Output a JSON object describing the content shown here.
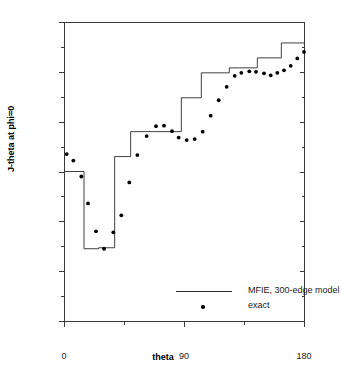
{
  "chart_data": {
    "type": "scatter",
    "title": "",
    "xlabel": "theta",
    "ylabel": "J-theta at phi=0",
    "xlim": [
      0,
      180
    ],
    "ylim": [
      0.0,
      0.006
    ],
    "grid": false,
    "x_ticks": [
      0,
      90,
      180
    ],
    "x_tick_labels": [
      "0",
      "90",
      "180"
    ],
    "x_minor_ticks": [
      45,
      135
    ],
    "y_ticks": [
      0.0,
      0.001,
      0.002,
      0.003,
      0.004,
      0.005,
      0.006
    ],
    "y_tick_labels": [
      "0.000",
      "0.001",
      "0.002",
      "0.003",
      "0.004",
      "0.005",
      "0.006"
    ],
    "y_minor_ticks": [
      0.0005,
      0.0015,
      0.0025,
      0.0035,
      0.0045,
      0.0055
    ],
    "legend_position": "center-bottom-inside",
    "series": [
      {
        "name": "MFIE, 300-edge model",
        "type": "step",
        "style": "line",
        "color": "#2b2b2b",
        "x": [
          0,
          15,
          15,
          26,
          26,
          38,
          38,
          50,
          50,
          68,
          68,
          88,
          88,
          103,
          103,
          124,
          124,
          145,
          145,
          163,
          163,
          180
        ],
        "y": [
          0.003,
          0.003,
          0.00145,
          0.00145,
          0.00147,
          0.00147,
          0.0033,
          0.0033,
          0.0038,
          0.0038,
          0.0038,
          0.0038,
          0.00448,
          0.00448,
          0.00498,
          0.00498,
          0.00508,
          0.00508,
          0.00528,
          0.00528,
          0.00558,
          0.00558
        ]
      },
      {
        "name": "exact",
        "type": "scatter",
        "style": "points",
        "color": "#000000",
        "points": [
          [
            2,
            0.00335
          ],
          [
            7,
            0.00322
          ],
          [
            13,
            0.0029
          ],
          [
            18,
            0.00236
          ],
          [
            24,
            0.0018
          ],
          [
            30,
            0.00145
          ],
          [
            37,
            0.00178
          ],
          [
            43,
            0.00212
          ],
          [
            49,
            0.00278
          ],
          [
            55,
            0.00333
          ],
          [
            62,
            0.00371
          ],
          [
            69,
            0.00391
          ],
          [
            75,
            0.00392
          ],
          [
            81,
            0.00381
          ],
          [
            86,
            0.00368
          ],
          [
            92,
            0.00363
          ],
          [
            98,
            0.00365
          ],
          [
            104,
            0.0038
          ],
          [
            110,
            0.00412
          ],
          [
            116,
            0.00443
          ],
          [
            122,
            0.0047
          ],
          [
            128,
            0.00492
          ],
          [
            133,
            0.00498
          ],
          [
            139,
            0.00501
          ],
          [
            144,
            0.005
          ],
          [
            150,
            0.00497
          ],
          [
            155,
            0.00493
          ],
          [
            160,
            0.00498
          ],
          [
            165,
            0.00503
          ],
          [
            170,
            0.00512
          ],
          [
            175,
            0.00527
          ],
          [
            180,
            0.0054
          ],
          [
            184,
            0.00546
          ],
          [
            188,
            0.00548
          ],
          [
            192,
            0.00551
          ],
          [
            196,
            0.00551
          ]
        ]
      }
    ]
  },
  "axes": {
    "x_title": "theta",
    "y_title": "J-theta at phi=0"
  },
  "legend": {
    "entries": [
      {
        "label": "MFIE, 300-edge model",
        "symbol": "line"
      },
      {
        "label": "exact",
        "symbol": "dot"
      }
    ]
  },
  "ticks": {
    "y": [
      "0.006",
      "0.005",
      "0.004",
      "0.003",
      "0.002",
      "0.001",
      "0.000"
    ],
    "x": [
      "0",
      "90",
      "180"
    ]
  }
}
